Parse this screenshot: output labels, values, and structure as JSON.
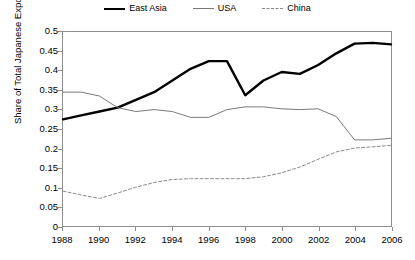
{
  "chart_data": {
    "type": "line",
    "title": "",
    "xlabel": "",
    "ylabel": "Share of Total Japanese Exports",
    "xlim": [
      1988,
      2006
    ],
    "ylim": [
      0,
      0.5
    ],
    "grid": false,
    "legend_position": "top-center",
    "x": [
      1988,
      1989,
      1990,
      1991,
      1992,
      1993,
      1994,
      1995,
      1996,
      1997,
      1998,
      1999,
      2000,
      2001,
      2002,
      2003,
      2004,
      2005,
      2006
    ],
    "xticks": [
      "1988",
      "1990",
      "1992",
      "1994",
      "1996",
      "1998",
      "2000",
      "2002",
      "2004",
      "2006"
    ],
    "yticks": [
      "0",
      "0.05",
      "0.1",
      "0.15",
      "0.2",
      "0.25",
      "0.3",
      "0.35",
      "0.4",
      "0.45",
      "0.5"
    ],
    "series": [
      {
        "name": "East Asia",
        "style": "solid-thick",
        "color": "#000000",
        "values": [
          0.275,
          0.285,
          0.295,
          0.305,
          0.325,
          0.345,
          0.375,
          0.405,
          0.425,
          0.425,
          0.337,
          0.375,
          0.397,
          0.392,
          0.415,
          0.445,
          0.47,
          0.472,
          0.468
        ]
      },
      {
        "name": "USA",
        "style": "solid-thin",
        "color": "#7a7a7a",
        "values": [
          0.345,
          0.345,
          0.335,
          0.305,
          0.295,
          0.3,
          0.295,
          0.28,
          0.28,
          0.3,
          0.307,
          0.307,
          0.302,
          0.3,
          0.302,
          0.282,
          0.222,
          0.222,
          0.226
        ]
      },
      {
        "name": "China",
        "style": "dashed",
        "color": "#8a8a8a",
        "values": [
          0.09,
          0.08,
          0.071,
          0.085,
          0.1,
          0.112,
          0.12,
          0.122,
          0.122,
          0.122,
          0.122,
          0.127,
          0.137,
          0.152,
          0.172,
          0.191,
          0.201,
          0.204,
          0.208
        ]
      }
    ]
  },
  "legend": {
    "items": [
      {
        "label": "East Asia"
      },
      {
        "label": "USA"
      },
      {
        "label": "China"
      }
    ]
  },
  "axes": {
    "y_title": "Share of Total Japanese Exports"
  }
}
